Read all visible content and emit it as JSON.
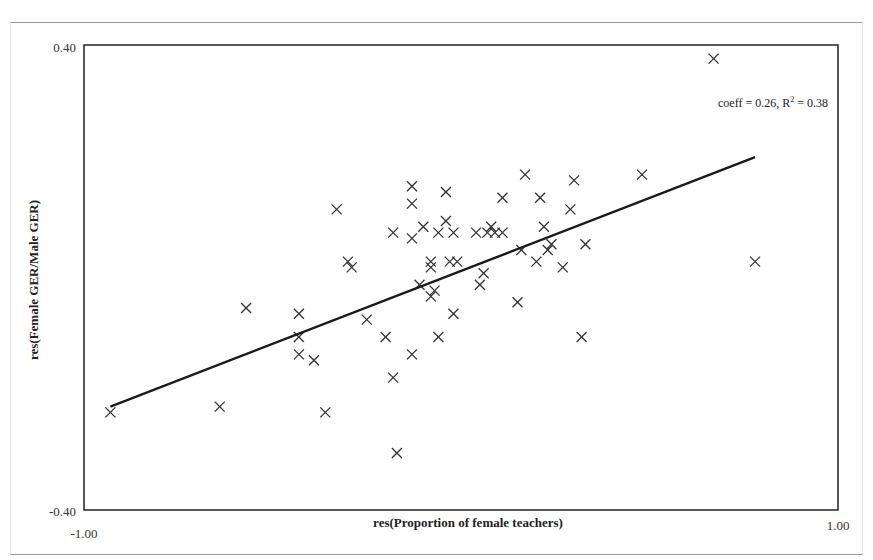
{
  "chart_data": {
    "type": "scatter",
    "title": "",
    "xlabel": "res(Proportion of female teachers)",
    "ylabel": "res(Female GER/Male GER)",
    "xlim": [
      -1.0,
      1.0
    ],
    "ylim": [
      -0.4,
      0.4
    ],
    "x_tick_labels": [
      "-1.00",
      "1.00"
    ],
    "y_tick_labels": [
      "0.40",
      "-0.40"
    ],
    "grid": false,
    "legend": null,
    "annotation": {
      "text_prefix": "coeff = 0.26, R",
      "superscript": "2",
      "text_suffix": " = 0.38"
    },
    "marker": "x",
    "trendline": {
      "x": [
        -0.93,
        0.78
      ],
      "y": [
        -0.22,
        0.21
      ],
      "slope_label": "coeff = 0.26",
      "r_squared": 0.38
    },
    "points": [
      {
        "x": -0.93,
        "y": -0.23
      },
      {
        "x": -0.64,
        "y": -0.22
      },
      {
        "x": -0.57,
        "y": -0.05
      },
      {
        "x": -0.43,
        "y": -0.06
      },
      {
        "x": -0.43,
        "y": -0.1
      },
      {
        "x": -0.43,
        "y": -0.13
      },
      {
        "x": -0.33,
        "y": 0.12
      },
      {
        "x": -0.3,
        "y": 0.03
      },
      {
        "x": -0.29,
        "y": 0.02
      },
      {
        "x": -0.36,
        "y": -0.23
      },
      {
        "x": -0.39,
        "y": -0.14
      },
      {
        "x": -0.17,
        "y": -0.3
      },
      {
        "x": -0.25,
        "y": -0.07
      },
      {
        "x": -0.2,
        "y": -0.1
      },
      {
        "x": -0.18,
        "y": -0.17
      },
      {
        "x": -0.13,
        "y": -0.13
      },
      {
        "x": -0.13,
        "y": 0.13
      },
      {
        "x": -0.13,
        "y": 0.16
      },
      {
        "x": -0.1,
        "y": 0.09
      },
      {
        "x": -0.13,
        "y": 0.07
      },
      {
        "x": -0.06,
        "y": 0.08
      },
      {
        "x": -0.04,
        "y": 0.15
      },
      {
        "x": -0.04,
        "y": 0.1
      },
      {
        "x": -0.02,
        "y": 0.08
      },
      {
        "x": -0.18,
        "y": 0.08
      },
      {
        "x": -0.08,
        "y": 0.03
      },
      {
        "x": -0.08,
        "y": 0.02
      },
      {
        "x": -0.03,
        "y": 0.03
      },
      {
        "x": -0.01,
        "y": 0.03
      },
      {
        "x": -0.11,
        "y": -0.01
      },
      {
        "x": -0.07,
        "y": -0.02
      },
      {
        "x": -0.08,
        "y": -0.03
      },
      {
        "x": -0.06,
        "y": -0.1
      },
      {
        "x": -0.02,
        "y": -0.06
      },
      {
        "x": 0.04,
        "y": 0.08
      },
      {
        "x": 0.07,
        "y": 0.08
      },
      {
        "x": 0.08,
        "y": 0.09
      },
      {
        "x": 0.09,
        "y": 0.08
      },
      {
        "x": 0.11,
        "y": 0.08
      },
      {
        "x": 0.11,
        "y": 0.14
      },
      {
        "x": 0.17,
        "y": 0.18
      },
      {
        "x": 0.16,
        "y": 0.05
      },
      {
        "x": 0.06,
        "y": 0.01
      },
      {
        "x": 0.05,
        "y": -0.01
      },
      {
        "x": 0.15,
        "y": -0.04
      },
      {
        "x": 0.21,
        "y": 0.14
      },
      {
        "x": 0.22,
        "y": 0.09
      },
      {
        "x": 0.24,
        "y": 0.06
      },
      {
        "x": 0.23,
        "y": 0.05
      },
      {
        "x": 0.2,
        "y": 0.03
      },
      {
        "x": 0.27,
        "y": 0.02
      },
      {
        "x": 0.29,
        "y": 0.12
      },
      {
        "x": 0.3,
        "y": 0.17
      },
      {
        "x": 0.33,
        "y": 0.06
      },
      {
        "x": 0.32,
        "y": -0.1
      },
      {
        "x": 0.48,
        "y": 0.18
      },
      {
        "x": 0.67,
        "y": 0.38
      },
      {
        "x": 0.78,
        "y": 0.03
      }
    ]
  }
}
